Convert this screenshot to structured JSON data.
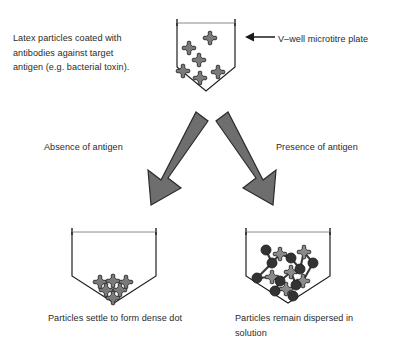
{
  "figure": {
    "background_color": "#ffffff",
    "text_color": "#2b2b2b"
  },
  "labels": {
    "latex_particles": "Latex particles coated with\nantibodies against target\nantigen (e.g. bacterial toxin).",
    "microtitre_plate": "V–well microtitre plate",
    "absence_of_antigen": "Absence of antigen",
    "presence_of_antigen": "Presence of antigen"
  },
  "captions": {
    "left": "Particles settle to form dense dot",
    "right": "Particles remain dispersed in\nsolution"
  },
  "colors": {
    "latex_particle_fill": "#7a7a7a",
    "latex_particle_stroke": "#2b2b2b",
    "antigen_fill": "#333333",
    "antigen_stroke": "#1a1a1a",
    "well_stroke": "#231f20",
    "arrow_fill": "#6e6e6e",
    "arrow_stroke": "#2b2b2b",
    "pointer_arrow": "#1a1a1a"
  },
  "icons": {
    "latex_particle": "clover-particle-icon",
    "antigen": "antigen-circle-icon",
    "well": "v-well-icon",
    "flow_arrow": "thick-diagonal-arrow-icon",
    "pointer": "left-pointing-arrow-icon"
  },
  "wells": {
    "top": {
      "name": "top-well",
      "x": 177,
      "y": 19,
      "width": 58,
      "rect_height": 48,
      "v_depth": 24,
      "particles": [
        {
          "x": 210,
          "y": 38,
          "size": 13
        },
        {
          "x": 189,
          "y": 48,
          "size": 12
        },
        {
          "x": 199,
          "y": 60,
          "size": 12
        },
        {
          "x": 183,
          "y": 71,
          "size": 12
        },
        {
          "x": 200,
          "y": 78,
          "size": 12
        },
        {
          "x": 218,
          "y": 72,
          "size": 12
        }
      ]
    },
    "bottom_left": {
      "name": "bottom-left-well",
      "x": 72,
      "y": 228,
      "width": 84,
      "rect_height": 48,
      "v_depth": 27,
      "cluster": [
        {
          "x": 100,
          "y": 282,
          "size": 12
        },
        {
          "x": 113,
          "y": 281,
          "size": 12
        },
        {
          "x": 126,
          "y": 282,
          "size": 12
        },
        {
          "x": 106,
          "y": 290,
          "size": 12
        },
        {
          "x": 120,
          "y": 290,
          "size": 12
        },
        {
          "x": 113,
          "y": 298,
          "size": 12
        }
      ]
    },
    "bottom_right": {
      "name": "bottom-right-well",
      "x": 246,
      "y": 228,
      "width": 84,
      "rect_height": 48,
      "v_depth": 27,
      "lattice_particles": [
        {
          "x": 280,
          "y": 254,
          "size": 13
        },
        {
          "x": 304,
          "y": 252,
          "size": 13
        },
        {
          "x": 291,
          "y": 272,
          "size": 13
        },
        {
          "x": 272,
          "y": 277,
          "size": 13
        },
        {
          "x": 303,
          "y": 281,
          "size": 13
        },
        {
          "x": 286,
          "y": 289,
          "size": 13
        }
      ],
      "lattice_antigens": [
        {
          "x": 266,
          "y": 250,
          "r": 5
        },
        {
          "x": 291,
          "y": 258,
          "r": 5
        },
        {
          "x": 313,
          "y": 263,
          "r": 5
        },
        {
          "x": 272,
          "y": 263,
          "r": 5
        },
        {
          "x": 300,
          "y": 269,
          "r": 5
        },
        {
          "x": 257,
          "y": 278,
          "r": 5
        },
        {
          "x": 280,
          "y": 281,
          "r": 5
        },
        {
          "x": 296,
          "y": 285,
          "r": 5
        },
        {
          "x": 275,
          "y": 291,
          "r": 5
        },
        {
          "x": 293,
          "y": 296,
          "r": 5
        }
      ],
      "lattice_links": [
        {
          "x1": 266,
          "y1": 250,
          "x2": 272,
          "y2": 263
        },
        {
          "x1": 272,
          "y1": 263,
          "x2": 280,
          "y2": 254
        },
        {
          "x1": 280,
          "y1": 254,
          "x2": 291,
          "y2": 258
        },
        {
          "x1": 291,
          "y1": 258,
          "x2": 300,
          "y2": 269
        },
        {
          "x1": 300,
          "y1": 269,
          "x2": 304,
          "y2": 252
        },
        {
          "x1": 304,
          "y1": 252,
          "x2": 313,
          "y2": 263
        },
        {
          "x1": 272,
          "y1": 263,
          "x2": 257,
          "y2": 278
        },
        {
          "x1": 257,
          "y1": 278,
          "x2": 272,
          "y2": 277
        },
        {
          "x1": 272,
          "y1": 277,
          "x2": 280,
          "y2": 281
        },
        {
          "x1": 280,
          "y1": 281,
          "x2": 291,
          "y2": 272
        },
        {
          "x1": 291,
          "y1": 272,
          "x2": 300,
          "y2": 269
        },
        {
          "x1": 291,
          "y1": 272,
          "x2": 296,
          "y2": 285
        },
        {
          "x1": 296,
          "y1": 285,
          "x2": 303,
          "y2": 281
        },
        {
          "x1": 280,
          "y1": 281,
          "x2": 275,
          "y2": 291
        },
        {
          "x1": 275,
          "y1": 291,
          "x2": 286,
          "y2": 289
        },
        {
          "x1": 286,
          "y1": 289,
          "x2": 293,
          "y2": 296
        },
        {
          "x1": 313,
          "y1": 263,
          "x2": 303,
          "y2": 281
        }
      ]
    }
  },
  "arrows": {
    "left_flow": {
      "name": "absence-flow-arrow",
      "from_x": 198,
      "from_y": 113,
      "to_x": 153,
      "to_y": 205
    },
    "right_flow": {
      "name": "presence-flow-arrow",
      "from_x": 226,
      "from_y": 113,
      "to_x": 268,
      "to_y": 205
    },
    "plate_pointer": {
      "name": "plate-pointer-arrow",
      "from_x": 275,
      "from_y": 37,
      "to_x": 245,
      "to_y": 37
    }
  }
}
